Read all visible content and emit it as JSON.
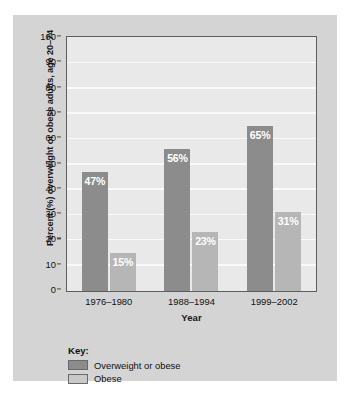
{
  "chart_data": {
    "type": "bar",
    "title": "",
    "subtitle": "",
    "categories": [
      "1976–1980",
      "1988–1994",
      "1999–2002"
    ],
    "series": [
      {
        "name": "Overweight or obese",
        "color": "#8c8c8c",
        "values": [
          47,
          56,
          65
        ],
        "labels": [
          "47%",
          "56%",
          "65%"
        ]
      },
      {
        "name": "Obese",
        "color": "#b6b6b6",
        "values": [
          15,
          23,
          31
        ],
        "labels": [
          "15%",
          "23%",
          "31%"
        ]
      }
    ],
    "xlabel": "Year",
    "ylabel": "Percent (%) overweight or obese adults, age 20–74",
    "ylim": [
      0,
      100
    ],
    "ytick_step": 10,
    "yticks": [
      "0",
      "10",
      "20",
      "30",
      "40",
      "50",
      "60",
      "70",
      "80",
      "90",
      "100"
    ],
    "grid": true,
    "grid_color": "#fafafa",
    "legend_position": "bottom-left",
    "legend_title": "Key:",
    "plot_background": "#e9e9e9",
    "panel_background": "#d4d4d4",
    "frame_color": "#5e5e5e"
  },
  "legend": {
    "title": "Key:",
    "items": [
      {
        "label": "Overweight or obese",
        "swatch": "dark"
      },
      {
        "label": "Obese",
        "swatch": "light"
      }
    ]
  },
  "axes": {
    "x_title": "Year",
    "y_title": "Percent (%) overweight or obese adults, age 20–74"
  }
}
